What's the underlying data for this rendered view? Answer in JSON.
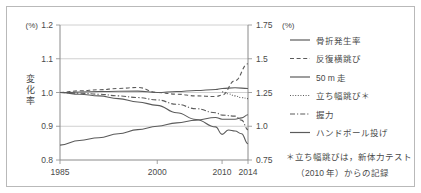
{
  "figure": {
    "left_axis_unit": "(%)",
    "right_axis_unit": "(%)",
    "y_axis_title": "変化率",
    "note_line1": "＊立ち幅跳びは，新体力テスト",
    "note_line2": "（2010 年）からの記録"
  },
  "chart_data": {
    "type": "line",
    "title": "",
    "xlabel": "",
    "ylabel": "変化率",
    "x_ticks": [
      "1985",
      "2000",
      "2010",
      "2014"
    ],
    "x_tick_values": [
      1985,
      2000,
      2010,
      2014
    ],
    "xlim": [
      1985,
      2014
    ],
    "left_axis": {
      "unit": "(%)",
      "ticks": [
        "1.2",
        "1.1",
        "1.0",
        "0.9",
        "0.8"
      ],
      "tick_values": [
        1.2,
        1.1,
        1.0,
        0.9,
        0.8
      ],
      "ylim": [
        0.8,
        1.2
      ]
    },
    "right_axis": {
      "unit": "(%)",
      "ticks": [
        "1.75",
        "1.5",
        "1.25",
        "1.0",
        "0.75"
      ],
      "tick_values": [
        1.75,
        1.5,
        1.25,
        1.0,
        0.75
      ],
      "ylim": [
        0.75,
        1.75
      ]
    },
    "grid": "horizontal",
    "legend_position": "right",
    "series": [
      {
        "name": "骨折発生率",
        "style": "solid",
        "axis": "right",
        "x": [
          1985,
          1988,
          1991,
          1994,
          1997,
          2000,
          2003,
          2006,
          2009,
          2010,
          2012,
          2013,
          2014
        ],
        "values": [
          0.86,
          0.895,
          0.915,
          0.945,
          0.975,
          1.0,
          1.025,
          1.045,
          1.065,
          1.052,
          1.052,
          1.062,
          1.085
        ]
      },
      {
        "name": "反復横跳び",
        "style": "dashed",
        "axis": "left",
        "x": [
          1985,
          1988,
          1991,
          1994,
          1997,
          2000,
          2003,
          2006,
          2009,
          2010,
          2012,
          2014
        ],
        "values": [
          1.0,
          1.005,
          1.008,
          1.012,
          1.015,
          1.0,
          0.995,
          0.99,
          0.988,
          0.992,
          1.035,
          1.085
        ]
      },
      {
        "name": "50 m 走",
        "style": "solid",
        "axis": "left",
        "x": [
          1985,
          1991,
          1997,
          2000,
          2003,
          2006,
          2009,
          2010,
          2012,
          2014
        ],
        "values": [
          1.0,
          1.003,
          1.004,
          1.0,
          1.003,
          1.006,
          1.009,
          1.012,
          1.014,
          1.012
        ]
      },
      {
        "name": "立ち幅跳び＊",
        "style": "dotted",
        "axis": "left",
        "x": [
          2010,
          2011,
          2012,
          2013,
          2014
        ],
        "values": [
          1.002,
          0.996,
          0.99,
          0.985,
          0.982
        ]
      },
      {
        "name": "握力",
        "style": "dashdot",
        "axis": "left",
        "x": [
          1985,
          1988,
          1991,
          1994,
          1997,
          2000,
          2003,
          2006,
          2009,
          2010,
          2012,
          2013,
          2014
        ],
        "values": [
          1.0,
          0.998,
          0.995,
          0.99,
          0.985,
          0.978,
          0.965,
          0.952,
          0.94,
          0.933,
          0.93,
          0.918,
          0.89
        ]
      },
      {
        "name": "ハンドボール投げ",
        "style": "solid",
        "axis": "left",
        "x": [
          1985,
          1988,
          1991,
          1994,
          1997,
          2000,
          2003,
          2006,
          2009,
          2010,
          2011,
          2012,
          2013,
          2014
        ],
        "values": [
          1.0,
          0.995,
          0.99,
          0.982,
          0.972,
          0.962,
          0.94,
          0.92,
          0.898,
          0.876,
          0.889,
          0.886,
          0.878,
          0.848
        ]
      }
    ]
  },
  "legend": {
    "items": [
      {
        "label": "骨折発生率",
        "style": "solid"
      },
      {
        "label": "反復横跳び",
        "style": "dashed"
      },
      {
        "label": "50 m 走",
        "style": "solid"
      },
      {
        "label": "立ち幅跳び＊",
        "style": "dotted"
      },
      {
        "label": "握力",
        "style": "dashdot"
      },
      {
        "label": "ハンドボール投げ",
        "style": "solid"
      }
    ]
  }
}
